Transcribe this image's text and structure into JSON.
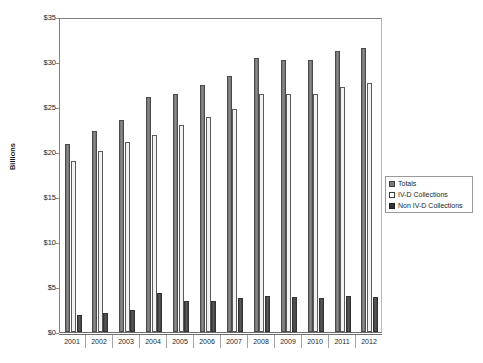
{
  "chart_data": {
    "type": "bar",
    "title": "",
    "xlabel": "",
    "ylabel": "Billions",
    "ylim": [
      0,
      35
    ],
    "ytick_labels": [
      "$35",
      "$30",
      "$25",
      "$20",
      "$15",
      "$10",
      "$5",
      "$0"
    ],
    "ytick_values": [
      35,
      30,
      25,
      20,
      15,
      10,
      5,
      0
    ],
    "grid": false,
    "legend_position": "right",
    "categories": [
      "2001",
      "2002",
      "2003",
      "2004",
      "2005",
      "2006",
      "2007",
      "2008",
      "2009",
      "2010",
      "2011",
      "2012"
    ],
    "series": [
      {
        "name": "Totals",
        "color": "#7a7a7a",
        "values": [
          20.9,
          22.3,
          23.6,
          26.1,
          26.4,
          27.4,
          28.5,
          30.4,
          30.2,
          30.2,
          31.2,
          31.6
        ]
      },
      {
        "name": "IV-D Collections",
        "color": "#ffffff",
        "values": [
          19.0,
          20.1,
          21.1,
          21.9,
          23.0,
          23.9,
          24.8,
          26.4,
          26.4,
          26.4,
          27.2,
          27.7
        ]
      },
      {
        "name": "Non IV-D Collections",
        "color": "#333333",
        "values": [
          1.9,
          2.1,
          2.5,
          4.3,
          3.4,
          3.5,
          3.8,
          4.0,
          3.9,
          3.8,
          4.0,
          3.9
        ]
      }
    ]
  },
  "legend": {
    "items": [
      {
        "label": "Totals",
        "swatch": "totals"
      },
      {
        "label": "IV-D Collections",
        "swatch": "ivd"
      },
      {
        "label": "Non IV-D Collections",
        "swatch": "nonivd"
      }
    ]
  }
}
